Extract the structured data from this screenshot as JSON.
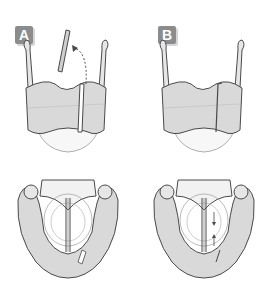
{
  "panels": [
    {
      "label": "A",
      "description": "Thyroid cartilage with strip removed (dashed arrow shows strip lifted out)"
    },
    {
      "label": "B",
      "description": "Thyroid cartilage with lateral segment displaced / overlapped"
    }
  ],
  "colors": {
    "cartilage_fill": "#d9d9d9",
    "outline": "#4a4a4a",
    "badge": "#8c8c8c",
    "background": "#ffffff"
  }
}
